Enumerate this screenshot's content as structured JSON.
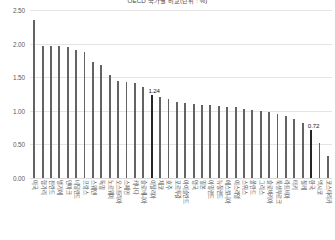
{
  "chart_data": {
    "type": "bar",
    "title": "OECD 국가별 비교(단위 : %)",
    "xlabel": "",
    "ylabel": "",
    "ylim": [
      0.0,
      2.5
    ],
    "ytick_labels": [
      "2.50",
      "2.00",
      "1.50",
      "1.00",
      "0.50",
      "0.00"
    ],
    "ytick_values": [
      2.5,
      2.0,
      1.5,
      1.0,
      0.5,
      0.0
    ],
    "grid": true,
    "legend": null,
    "legend_position": "none",
    "bar_color": "#636363",
    "highlight_color": "#262626",
    "categories": [
      "미국",
      "헝가리",
      "핀란드",
      "벨기에",
      "덴마크",
      "네덜란드",
      "프랑스",
      "스웨덴",
      "독일",
      "노르웨이",
      "오스트리아",
      "스페인",
      "캐나다",
      "슬로베니아",
      "이탈리아",
      "체코",
      "호주",
      "포르투갈",
      "아이슬란드",
      "영국",
      "일본",
      "아일랜드",
      "뉴질랜드",
      "에스토니아",
      "이스라엘",
      "스위스",
      "폴란드",
      "그리스",
      "슬로바키아",
      "룩셈부르크",
      "라트비아",
      "터키",
      "칠레",
      "한국",
      "멕시코",
      "코스타리카"
    ],
    "values": [
      2.35,
      1.97,
      1.97,
      1.96,
      1.95,
      1.91,
      1.88,
      1.72,
      1.68,
      1.54,
      1.44,
      1.43,
      1.42,
      1.36,
      1.24,
      1.2,
      1.18,
      1.13,
      1.11,
      1.1,
      1.09,
      1.08,
      1.07,
      1.06,
      1.05,
      1.03,
      1.01,
      1.0,
      0.98,
      0.95,
      0.92,
      0.88,
      0.82,
      0.72,
      0.52,
      0.33
    ],
    "annotations": [
      {
        "index": 14,
        "label": "1.24",
        "value": 1.24
      },
      {
        "index": 33,
        "label": "0.72",
        "value": 0.72
      }
    ],
    "highlighted_indices": [
      14,
      33
    ]
  }
}
